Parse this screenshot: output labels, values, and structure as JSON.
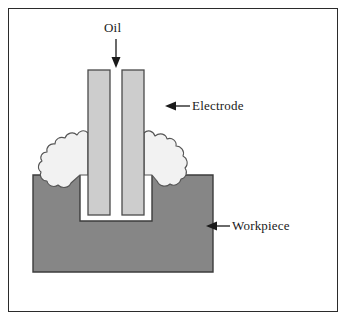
{
  "figure": {
    "background_color": "#ffffff",
    "frame_color": "#2b2b2b"
  },
  "labels": {
    "oil": "Oil",
    "electrode": "Electrode",
    "workpiece": "Workpiece"
  },
  "annotations": {
    "oil_arrow": "down-arrow-icon",
    "electrode_arrow": "left-arrow-icon",
    "workpiece_arrow": "left-arrow-icon"
  },
  "parts": {
    "electrode": {
      "name": "Electrode",
      "fill_color": "#cdcdcd",
      "stroke_color": "#4a4a4a",
      "shape": "u-shaped-twin-prong",
      "left_prong": {
        "x": 88,
        "y": 70,
        "width": 22,
        "height": 145
      },
      "right_prong": {
        "x": 122,
        "y": 70,
        "width": 22,
        "height": 145
      }
    },
    "workpiece": {
      "name": "Workpiece",
      "fill_color": "#868686",
      "stroke_color": "#3c3c3c",
      "shape": "block-with-rectangular-cavity",
      "block": {
        "x": 33,
        "y": 175,
        "width": 180,
        "height": 97
      },
      "cavity": {
        "x": 80,
        "y": 175,
        "width": 72,
        "height": 46
      }
    },
    "dielectric_gap": {
      "name": "Dielectric oil gap",
      "fill_color": "#ffffff"
    },
    "debris_cloud_left": {
      "name": "Spark debris cloud (left)",
      "fill_color": "#f2f2f2",
      "stroke_color": "#555555"
    },
    "debris_cloud_right": {
      "name": "Spark debris cloud (right)",
      "fill_color": "#f2f2f2",
      "stroke_color": "#555555"
    }
  }
}
